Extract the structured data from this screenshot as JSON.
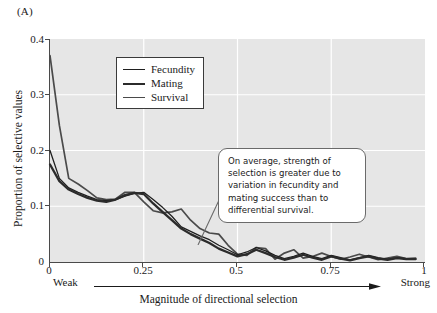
{
  "panel": {
    "label": "(A)"
  },
  "axes": {
    "y_title": "Proportion of selective values",
    "x_title": "Magnitude of directional selection",
    "y_ticks": [
      "0.4",
      "0.3",
      "0.2",
      "0.1",
      "0"
    ],
    "x_ticks": [
      "0",
      "0.25",
      "0.5",
      "0.75",
      "1"
    ],
    "weak_label": "Weak",
    "strong_label": "Strong"
  },
  "legend": {
    "items": [
      {
        "label": "Fecundity",
        "color": "#1f1f1f",
        "width": 1.3
      },
      {
        "label": "Mating",
        "color": "#2b2b2b",
        "width": 2.3
      },
      {
        "label": "Survival",
        "color": "#4a4a4a",
        "width": 1.7
      }
    ]
  },
  "callout": {
    "text": "On average, strength of selection is greater due to variation in fecundity and mating success than to differential survival."
  },
  "chart_data": {
    "type": "line",
    "title": "",
    "xlabel": "Magnitude of directional selection",
    "ylabel": "Proportion of selective values",
    "xlim": [
      0,
      1
    ],
    "ylim": [
      0,
      0.4
    ],
    "xticks": [
      0,
      0.25,
      0.5,
      0.75,
      1
    ],
    "yticks": [
      0,
      0.1,
      0.2,
      0.3,
      0.4
    ],
    "grid": true,
    "grid_color": "#ffffff",
    "plot_background": "#e6e6e6",
    "legend_position": "upper-center-left",
    "x": [
      0.0,
      0.025,
      0.05,
      0.075,
      0.1,
      0.125,
      0.15,
      0.175,
      0.2,
      0.225,
      0.25,
      0.275,
      0.3,
      0.325,
      0.35,
      0.375,
      0.4,
      0.425,
      0.45,
      0.475,
      0.5,
      0.525,
      0.55,
      0.575,
      0.6,
      0.625,
      0.65,
      0.675,
      0.7,
      0.725,
      0.75,
      0.775,
      0.8,
      0.825,
      0.85,
      0.875,
      0.9,
      0.925,
      0.95,
      0.975
    ],
    "series": [
      {
        "name": "Fecundity",
        "color": "#1f1f1f",
        "values": [
          0.2,
          0.15,
          0.133,
          0.125,
          0.118,
          0.112,
          0.11,
          0.112,
          0.118,
          0.123,
          0.125,
          0.112,
          0.098,
          0.082,
          0.063,
          0.055,
          0.047,
          0.04,
          0.03,
          0.022,
          0.013,
          0.018,
          0.026,
          0.02,
          0.012,
          0.006,
          0.01,
          0.016,
          0.01,
          0.006,
          0.012,
          0.008,
          0.004,
          0.008,
          0.012,
          0.008,
          0.005,
          0.008,
          0.006,
          0.006
        ]
      },
      {
        "name": "Mating",
        "color": "#2b2b2b",
        "values": [
          0.175,
          0.145,
          0.13,
          0.122,
          0.115,
          0.11,
          0.108,
          0.112,
          0.12,
          0.124,
          0.122,
          0.105,
          0.09,
          0.075,
          0.06,
          0.05,
          0.042,
          0.034,
          0.024,
          0.017,
          0.01,
          0.014,
          0.022,
          0.016,
          0.009,
          0.004,
          0.008,
          0.013,
          0.008,
          0.004,
          0.01,
          0.006,
          0.003,
          0.007,
          0.01,
          0.006,
          0.004,
          0.007,
          0.005,
          0.005
        ]
      },
      {
        "name": "Survival",
        "color": "#4a4a4a",
        "values": [
          0.37,
          0.245,
          0.15,
          0.14,
          0.128,
          0.115,
          0.112,
          0.113,
          0.125,
          0.125,
          0.108,
          0.092,
          0.088,
          0.09,
          0.095,
          0.075,
          0.06,
          0.052,
          0.05,
          0.03,
          0.014,
          0.012,
          0.026,
          0.024,
          0.005,
          0.016,
          0.022,
          0.007,
          0.01,
          0.016,
          0.01,
          0.005,
          0.009,
          0.014,
          0.009,
          0.004,
          0.007,
          0.01,
          0.006,
          0.007
        ]
      }
    ]
  }
}
